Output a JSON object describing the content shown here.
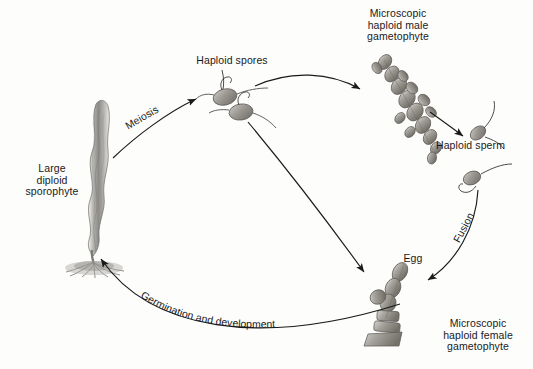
{
  "diagram": {
    "background_color": "#fdfdfc",
    "ink_color": "#1a1a1a",
    "labels": {
      "sporophyte": "Large\ndiploid\nsporophyte",
      "sporophyte_lines": [
        "Large",
        "diploid",
        "sporophyte"
      ],
      "haploid_spores": "Haploid spores",
      "male_gametophyte": "Microscopic\nhaploid male\ngametophyte",
      "male_gametophyte_lines": [
        "Microscopic",
        "haploid male",
        "gametophyte"
      ],
      "haploid_sperm": "Haploid sperm",
      "egg": "Egg",
      "female_gametophyte": "Microscopic\nhaploid female\ngametophyte",
      "female_gametophyte_lines": [
        "Microscopic",
        "haploid female",
        "gametophyte"
      ]
    },
    "process_labels": {
      "meiosis": "Meiosis",
      "fusion": "Fusion",
      "germination": "Germination and development",
      "germination_chars": [
        "G",
        "e",
        "r",
        "m",
        "i",
        "n",
        "a",
        "t",
        "i",
        "o",
        "n",
        " ",
        "a",
        "n",
        "d",
        " ",
        "d",
        "e",
        "v",
        "e",
        "l",
        "o",
        "p",
        "m",
        "e",
        "n",
        "t"
      ]
    },
    "structures": [
      {
        "name": "large-diploid-sporophyte",
        "description": "tall wavy blade with root-like holdfast"
      },
      {
        "name": "haploid-spore-upper",
        "description": "oval spore with curling filament"
      },
      {
        "name": "haploid-spore-lower",
        "description": "oval spore with curling filament"
      },
      {
        "name": "male-gametophyte-filament",
        "description": "branched segmented filament"
      },
      {
        "name": "haploid-sperm-upper",
        "description": "oval cell with flagellum"
      },
      {
        "name": "haploid-sperm-lower",
        "description": "oval cell with flagellum"
      },
      {
        "name": "female-gametophyte-filament",
        "description": "segmented filament bearing an egg"
      }
    ],
    "arrows": [
      {
        "name": "meiosis-arrow",
        "from": "sporophyte",
        "to": "haploid-spores"
      },
      {
        "name": "spore-to-male-arrow",
        "from": "haploid-spore-upper",
        "to": "male-gametophyte"
      },
      {
        "name": "spore-to-female-arrow",
        "from": "haploid-spore-lower",
        "to": "female-gametophyte"
      },
      {
        "name": "sperm-release-arrow",
        "from": "male-gametophyte",
        "to": "haploid-sperm"
      },
      {
        "name": "fusion-arrow",
        "from": "haploid-sperm",
        "to": "egg"
      },
      {
        "name": "germination-arrow",
        "from": "female-gametophyte",
        "to": "sporophyte"
      }
    ]
  }
}
